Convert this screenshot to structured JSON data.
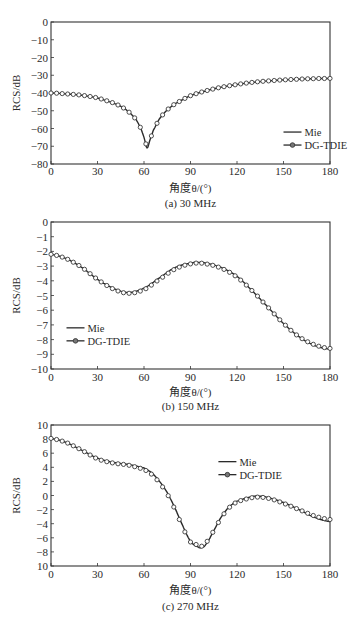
{
  "figure": {
    "x_axis_label": "角度θ/(°)",
    "y_axis_label": "RCS/dB",
    "legend": [
      {
        "name": "Mie",
        "style": "solid line"
      },
      {
        "name": "DG-TDIE",
        "style": "line with open circle markers"
      }
    ],
    "colors": {
      "line": "#2b2b2b",
      "marker": "#3a3a3a",
      "axis": "#333333",
      "background": "#ffffff"
    }
  },
  "chart_data": [
    {
      "type": "line",
      "caption": "(a) 30 MHz",
      "title": "",
      "xlabel": "角度θ/(°)",
      "ylabel": "RCS/dB",
      "xlim": [
        0,
        180
      ],
      "ylim": [
        -80,
        0
      ],
      "xticks": [
        0,
        30,
        60,
        90,
        120,
        150,
        180
      ],
      "yticks": [
        0,
        -10,
        -20,
        -30,
        -40,
        -50,
        -60,
        -70,
        -80
      ],
      "ytick_labels": [
        "0",
        "−10",
        "−20",
        "−30",
        "−40",
        "−50",
        "−60",
        "−70",
        "−80"
      ],
      "grid": false,
      "legend_position": {
        "x": 150,
        "y": -62
      },
      "x": [
        0,
        10,
        20,
        30,
        40,
        45,
        50,
        55,
        58,
        60,
        62,
        64,
        66,
        70,
        75,
        80,
        90,
        100,
        110,
        120,
        130,
        140,
        150,
        160,
        170,
        180
      ],
      "series": [
        {
          "name": "Mie",
          "values": [
            -40,
            -40.5,
            -41.3,
            -42.8,
            -45.5,
            -47.5,
            -50.5,
            -55,
            -60,
            -65,
            -71,
            -66,
            -61,
            -54.5,
            -49.5,
            -46,
            -41.5,
            -38.8,
            -36.7,
            -35.2,
            -34,
            -33.2,
            -32.6,
            -32.2,
            -31.9,
            -31.8
          ]
        },
        {
          "name": "DG-TDIE",
          "values": [
            -40,
            -40.5,
            -41.3,
            -42.8,
            -45.5,
            -47.5,
            -50.5,
            -55,
            -60,
            -65,
            -70,
            -66,
            -61,
            -54.5,
            -49.5,
            -46,
            -41.5,
            -38.8,
            -36.7,
            -35.2,
            -34,
            -33.2,
            -32.6,
            -32.2,
            -31.9,
            -31.8
          ]
        }
      ]
    },
    {
      "type": "line",
      "caption": "(b) 150 MHz",
      "title": "",
      "xlabel": "角度θ/(°)",
      "ylabel": "RCS/dB",
      "xlim": [
        0,
        180
      ],
      "ylim": [
        -10,
        0
      ],
      "xticks": [
        0,
        30,
        60,
        90,
        120,
        150,
        180
      ],
      "yticks": [
        0,
        -1,
        -2,
        -3,
        -4,
        -5,
        -6,
        -7,
        -8,
        -9,
        -10
      ],
      "ytick_labels": [
        "0",
        "−1",
        "−2",
        "−3",
        "−4",
        "−5",
        "−6",
        "−7",
        "−8",
        "−9",
        "−10"
      ],
      "grid": false,
      "legend_position": {
        "x": 10,
        "y": -7.2
      },
      "x": [
        0,
        10,
        20,
        30,
        40,
        50,
        60,
        70,
        80,
        90,
        95,
        100,
        110,
        120,
        130,
        140,
        150,
        160,
        170,
        180
      ],
      "series": [
        {
          "name": "Mie",
          "values": [
            -2.2,
            -2.5,
            -3.1,
            -3.9,
            -4.5,
            -4.8,
            -4.5,
            -3.8,
            -3.1,
            -2.8,
            -2.75,
            -2.8,
            -3.1,
            -3.7,
            -4.7,
            -5.8,
            -6.9,
            -7.8,
            -8.4,
            -8.65
          ]
        },
        {
          "name": "DG-TDIE",
          "values": [
            -2.2,
            -2.5,
            -3.1,
            -3.9,
            -4.55,
            -4.85,
            -4.6,
            -3.9,
            -3.2,
            -2.85,
            -2.8,
            -2.85,
            -3.15,
            -3.75,
            -4.7,
            -5.8,
            -6.9,
            -7.8,
            -8.35,
            -8.6
          ]
        }
      ]
    },
    {
      "type": "line",
      "caption": "(c) 270 MHz",
      "title": "",
      "xlabel": "角度θ/(°)",
      "ylabel": "RCS/dB",
      "xlim": [
        0,
        180
      ],
      "ylim": [
        -10,
        10
      ],
      "xticks": [
        0,
        30,
        60,
        90,
        120,
        150,
        180
      ],
      "yticks": [
        10,
        8,
        6,
        4,
        2,
        0,
        -2,
        -4,
        -6,
        -8,
        -10
      ],
      "ytick_labels": [
        "10",
        "8",
        "6",
        "4",
        "2",
        "0",
        "−2",
        "−4",
        "−6",
        "−8",
        "10"
      ],
      "grid": false,
      "legend_position": {
        "x": 108,
        "y": 4.8
      },
      "x": [
        0,
        10,
        20,
        30,
        40,
        50,
        60,
        65,
        70,
        75,
        80,
        85,
        90,
        95,
        97,
        100,
        105,
        110,
        115,
        120,
        130,
        135,
        140,
        150,
        160,
        170,
        180
      ],
      "series": [
        {
          "name": "Mie",
          "values": [
            8.1,
            7.5,
            6.4,
            5.3,
            4.7,
            4.4,
            3.9,
            3.2,
            2.0,
            0.4,
            -1.8,
            -4.3,
            -6.5,
            -7.3,
            -7.4,
            -6.9,
            -5.0,
            -3.0,
            -1.6,
            -0.8,
            -0.15,
            -0.1,
            -0.3,
            -1.0,
            -2.0,
            -3.1,
            -3.7
          ]
        },
        {
          "name": "DG-TDIE",
          "values": [
            8.1,
            7.5,
            6.4,
            5.2,
            4.6,
            4.3,
            3.7,
            3.0,
            1.8,
            0.2,
            -2.0,
            -4.5,
            -6.6,
            -7.0,
            -7.2,
            -6.7,
            -5.0,
            -3.1,
            -1.7,
            -0.9,
            -0.3,
            -0.25,
            -0.4,
            -1.1,
            -2.0,
            -2.9,
            -3.4
          ]
        }
      ]
    }
  ]
}
